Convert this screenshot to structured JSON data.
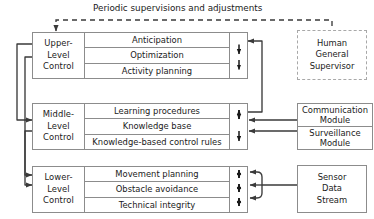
{
  "diagram": {
    "title": "Periodic supervisions and adjustments",
    "type": "hierarchical-control-architecture",
    "colors": {
      "border": "#8c8c8c",
      "dashed_border": "#a8a8a8",
      "line": "#3a3a3a",
      "text": "#1a1a1a",
      "background": "#ffffff"
    }
  },
  "levels": [
    {
      "id": "upper",
      "label_lines": [
        "Upper-",
        "Level",
        "Control"
      ],
      "rows": [
        "Anticipation",
        "Optimization",
        "Activity planning"
      ],
      "internal_arrows": [
        "down",
        "down"
      ]
    },
    {
      "id": "middle",
      "label_lines": [
        "Middle-",
        "Level",
        "Control"
      ],
      "rows": [
        "Learning procedures",
        "Knowledge base",
        "Knowledge-based control rules"
      ],
      "internal_arrows": [
        "up-down",
        "down"
      ]
    },
    {
      "id": "lower",
      "label_lines": [
        "Lower-",
        "Level",
        "Control"
      ],
      "rows": [
        "Movement planning",
        "Obstacle avoidance",
        "Technical integrity"
      ],
      "internal_arrows": [
        "up-down",
        "up-down",
        "up-down"
      ]
    }
  ],
  "side_boxes": [
    {
      "id": "human-general-supervisor",
      "lines": [
        "Human",
        "General",
        "Supervisor"
      ],
      "border": "dashed"
    },
    {
      "id": "communication-module",
      "lines": [
        "Communication",
        "Module"
      ],
      "border": "solid"
    },
    {
      "id": "surveillance-module",
      "lines": [
        "Surveillance",
        "Module"
      ],
      "border": "solid"
    },
    {
      "id": "sensor-data-stream",
      "lines": [
        "Sensor",
        "Data",
        "Stream"
      ],
      "border": "solid"
    }
  ]
}
